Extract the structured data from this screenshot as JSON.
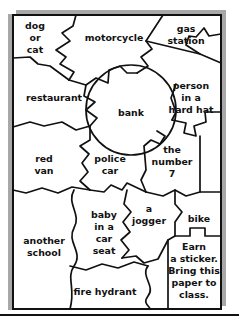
{
  "page": {
    "kind": "worksheet-puzzle-sheet",
    "background_color": "#ffffff",
    "ink_color": "#111111",
    "shadow_color": "#a8a8a8",
    "frame": {
      "x": 12,
      "y": 14,
      "width": 210,
      "height": 296,
      "border_px": 2
    },
    "shadow_offset_px": 4,
    "bottom_rule": {
      "y": 315,
      "thickness_px": 2
    }
  },
  "puzzle": {
    "title_visible": false,
    "piece_count": 16,
    "pieces": [
      {
        "id": "dog-or-cat",
        "label_lines": [
          "dog",
          "or",
          "cat"
        ],
        "cx": 35,
        "cy": 32
      },
      {
        "id": "motorcycle",
        "label_lines": [
          "motorcycle"
        ],
        "cx": 114,
        "cy": 38
      },
      {
        "id": "gas-station",
        "label_lines": [
          "gas",
          "station"
        ],
        "cx": 185,
        "cy": 32
      },
      {
        "id": "restaurant",
        "label_lines": [
          "restaurant"
        ],
        "cx": 56,
        "cy": 97
      },
      {
        "id": "bank",
        "label_lines": [
          "bank"
        ],
        "cx": 131,
        "cy": 110
      },
      {
        "id": "person-hard-hat",
        "label_lines": [
          "person",
          "in a",
          "hard hat"
        ],
        "cx": 190,
        "cy": 94
      },
      {
        "id": "red-van",
        "label_lines": [
          "red",
          "van"
        ],
        "cx": 44,
        "cy": 165
      },
      {
        "id": "police-car",
        "label_lines": [
          "police",
          "car"
        ],
        "cx": 105,
        "cy": 165
      },
      {
        "id": "the-number-7",
        "label_lines": [
          "the",
          "number",
          "7"
        ],
        "cx": 168,
        "cy": 157
      },
      {
        "id": "baby-in-car-seat",
        "label_lines": [
          "baby",
          "in a",
          "car",
          "seat"
        ],
        "cx": 106,
        "cy": 230
      },
      {
        "id": "a-jogger",
        "label_lines": [
          "a",
          "jogger"
        ],
        "cx": 149,
        "cy": 216
      },
      {
        "id": "bike",
        "label_lines": [
          "bike"
        ],
        "cx": 199,
        "cy": 218
      },
      {
        "id": "another-school",
        "label_lines": [
          "another",
          "school"
        ],
        "cx": 47,
        "cy": 245
      },
      {
        "id": "fire-hydrant",
        "label_lines": [
          "fire hydrant"
        ],
        "cx": 107,
        "cy": 291
      },
      {
        "id": "earn-a-sticker",
        "label_lines": [
          "Earn",
          "a sticker.",
          "Bring this",
          "paper to",
          "class."
        ],
        "cx": 186,
        "cy": 248
      }
    ]
  },
  "colors": {
    "ink": "#111111",
    "paper": "#ffffff",
    "shadow": "#a8a8a8"
  }
}
